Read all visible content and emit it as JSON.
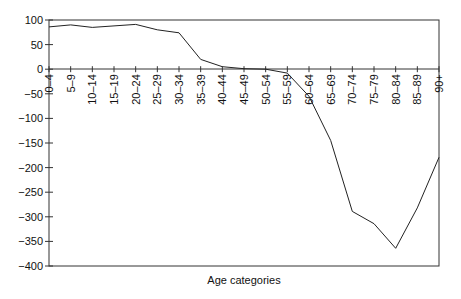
{
  "chart_data": {
    "type": "line",
    "title": "",
    "xlabel": "Age categories",
    "ylabel": "",
    "categories": [
      "0-4",
      "5-9",
      "10-14",
      "15-19",
      "20-24",
      "25-29",
      "30-34",
      "35-39",
      "40-44",
      "45-49",
      "50-54",
      "55-59",
      "60-64",
      "65-69",
      "70-74",
      "75-79",
      "80-84",
      "85-89",
      "90+"
    ],
    "series": [
      {
        "name": "",
        "values": [
          86,
          90,
          85,
          88,
          91,
          80,
          74,
          20,
          5,
          1,
          0,
          -8,
          -55,
          -145,
          -289,
          -314,
          -364,
          -282,
          -179
        ]
      }
    ],
    "ylim": [
      -400,
      100
    ],
    "yticks": [
      100,
      50,
      0,
      -50,
      -100,
      -150,
      -200,
      -250,
      -300,
      -350,
      -400
    ],
    "ytick_labels": [
      "100",
      "50",
      "0",
      "−50",
      "−100",
      "−150",
      "−200",
      "−250",
      "−300",
      "−350",
      "−400"
    ],
    "xtick_labels": [
      "0–4",
      "5–9",
      "10–14",
      "15–19",
      "20–24",
      "25–29",
      "30–34",
      "35–39",
      "40–44",
      "45–49",
      "50–54",
      "55–59",
      "60–64",
      "65–69",
      "70–74",
      "75–79",
      "80–84",
      "85–89",
      "90+"
    ],
    "grid": false,
    "legend": "none",
    "line_color": "#222222"
  }
}
